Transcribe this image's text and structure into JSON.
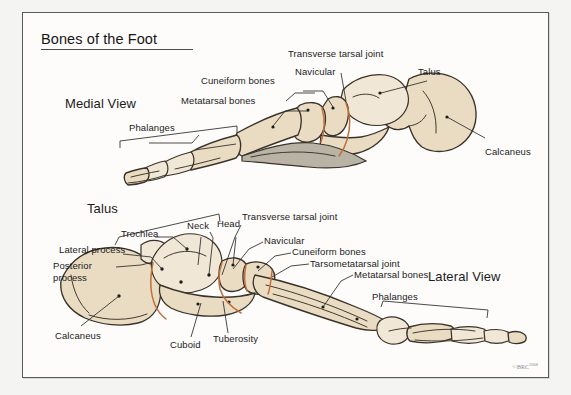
{
  "figure": {
    "title": "Bones of the Foot",
    "copyright_mark": "©BRC",
    "copyright_year": "2008",
    "colors": {
      "bone_fill": "#e9dcc3",
      "bone_fill_light": "#f0e7d6",
      "bone_outline": "#3a3228",
      "joint_line": "#c2703a",
      "shadow": "#b9b3a6",
      "panel_background": "#fdfcfa",
      "page_background": "#f4f4f2",
      "border": "#5a5a5a",
      "text": "#1b1b1b",
      "leader": "#2a2a2a"
    }
  },
  "views": {
    "medial": {
      "caption": "Medial View"
    },
    "lateral": {
      "caption": "Lateral View"
    }
  },
  "medial_labels": [
    {
      "text": "Transverse tarsal joint"
    },
    {
      "text": "Navicular"
    },
    {
      "text": "Talus"
    },
    {
      "text": "Cuneiform bones"
    },
    {
      "text": "Metatarsal bones"
    },
    {
      "text": "Phalanges"
    },
    {
      "text": "Calcaneus"
    }
  ],
  "lateral_labels": [
    {
      "text": "Talus"
    },
    {
      "text": "Trochlea"
    },
    {
      "text": "Neck"
    },
    {
      "text": "Head"
    },
    {
      "text": "Lateral process"
    },
    {
      "text": "Posterior"
    },
    {
      "text": "process"
    },
    {
      "text": "Transverse tarsal joint"
    },
    {
      "text": "Navicular"
    },
    {
      "text": "Cuneiform bones"
    },
    {
      "text": "Tarsometatarsal joint"
    },
    {
      "text": "Metatarsal bones"
    },
    {
      "text": "Phalanges"
    },
    {
      "text": "Calcaneus"
    },
    {
      "text": "Cuboid"
    },
    {
      "text": "Tuberosity"
    }
  ]
}
